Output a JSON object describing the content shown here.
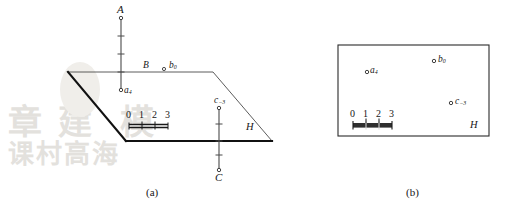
{
  "figure": {
    "panel_a": {
      "caption": "(a)",
      "plane_label": "H",
      "axes": [
        {
          "name": "axis-a",
          "cap_label": "A",
          "point_label": "a",
          "point_sub": "4",
          "direction": "up"
        },
        {
          "name": "axis-c",
          "cap_label": "C",
          "point_label": "c",
          "point_sub": "−3",
          "direction": "down"
        }
      ],
      "plane_points": [
        {
          "name": "point-b0",
          "prefix": "B",
          "label": "b",
          "sub": "0"
        }
      ],
      "scale_bar": {
        "ticks": [
          "0",
          "1",
          "2",
          "3"
        ]
      }
    },
    "panel_b": {
      "caption": "(b)",
      "plane_label": "H",
      "points": [
        {
          "name": "point-a4",
          "label": "a",
          "sub": "4"
        },
        {
          "name": "point-b0",
          "label": "b",
          "sub": "0"
        },
        {
          "name": "point-c-3",
          "label": "c",
          "sub": "−3"
        }
      ],
      "scale_bar": {
        "ticks": [
          "0",
          "1",
          "2",
          "3"
        ]
      }
    }
  },
  "colors": {
    "ink": "#161616",
    "line": "#3a3a3a",
    "background": "#ffffff"
  }
}
